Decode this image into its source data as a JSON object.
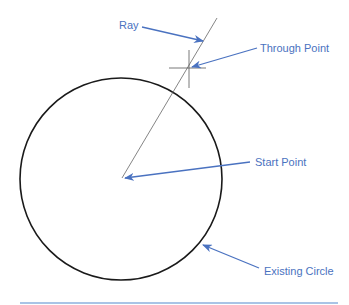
{
  "colors": {
    "annotation": "#4a72c0",
    "circle": "#1a1a1a",
    "ray": "#555555",
    "rule": "#a9c4e6",
    "background": "#ffffff"
  },
  "geometry": {
    "circle": {
      "cx": 121,
      "cy": 179,
      "r": 101
    },
    "ray": {
      "x1": 122,
      "y1": 178,
      "x2": 217,
      "y2": 18
    },
    "through_point": {
      "x": 189,
      "y": 68,
      "h_len": 37,
      "v_len": 38
    },
    "start_point": {
      "x": 122,
      "y": 178
    }
  },
  "labels": {
    "ray": "Ray",
    "through_point": "Through Point",
    "start_point": "Start Point",
    "existing_circle": "Existing Circle"
  },
  "annotations": [
    {
      "id": "ray",
      "text": "Ray",
      "label_x": 119,
      "label_y": 17,
      "arrow": {
        "x1": 142,
        "y1": 27,
        "x2": 203,
        "y2": 41
      }
    },
    {
      "id": "through_point",
      "text": "Through Point",
      "label_x": 260,
      "label_y": 42,
      "arrow": {
        "x1": 257,
        "y1": 48,
        "x2": 192,
        "y2": 67
      }
    },
    {
      "id": "start_point",
      "text": "Start Point",
      "label_x": 255,
      "label_y": 156,
      "arrow": {
        "x1": 250,
        "y1": 162,
        "x2": 125,
        "y2": 178
      }
    },
    {
      "id": "existing_circle",
      "text": "Existing Circle",
      "label_x": 264,
      "label_y": 265,
      "arrow": {
        "x1": 259,
        "y1": 268,
        "x2": 203,
        "y2": 245
      }
    }
  ]
}
